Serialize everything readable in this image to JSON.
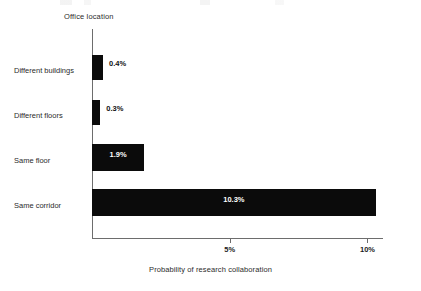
{
  "chart_data": {
    "type": "bar",
    "orientation": "horizontal",
    "title": "",
    "subtitle": "",
    "categories": [
      "Different buildings",
      "Different floors",
      "Same floor",
      "Same corridor"
    ],
    "values": [
      0.4,
      0.3,
      1.9,
      10.3
    ],
    "value_labels": [
      "0.4%",
      "0.3%",
      "1.9%",
      "10.3%"
    ],
    "label_placement": [
      "outside",
      "outside",
      "inside",
      "inside"
    ],
    "xlabel": "Probability of research collaboration",
    "ylabel": "Office location",
    "xlim": [
      0,
      10.6
    ],
    "xticks": [
      5,
      10
    ],
    "xtick_labels": [
      "5%",
      "10%"
    ],
    "grid": false,
    "legend": null,
    "bar_color": "#0b0b0b",
    "background_color": "#ffffff",
    "axis_color": "#6d6d6d",
    "inside_label_color": "#ffffff",
    "outside_label_color": "#111111"
  },
  "axis_titles": {
    "y": "Office location",
    "x": "Probability of research collaboration"
  }
}
